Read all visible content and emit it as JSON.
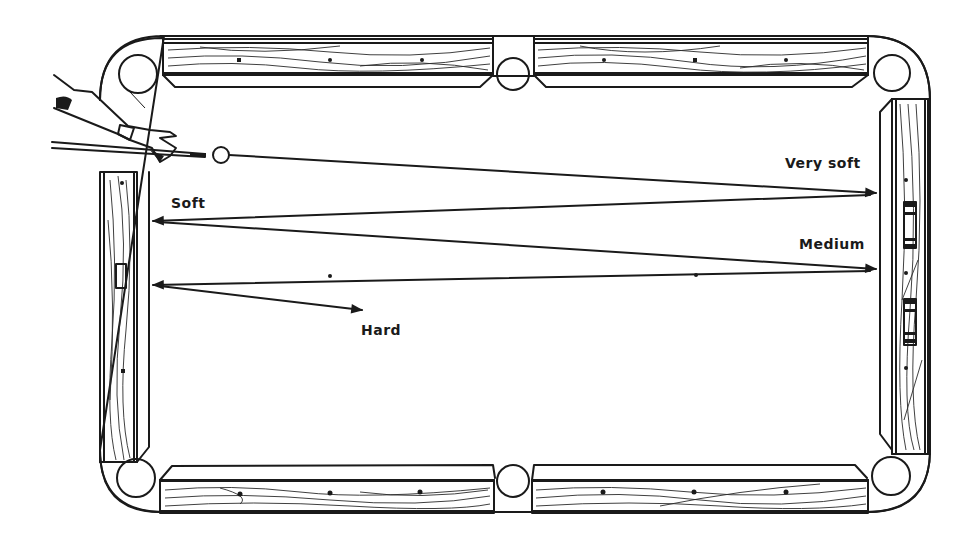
{
  "diagram": {
    "labels": {
      "very_soft": "Very soft",
      "soft": "Soft",
      "medium": "Medium",
      "hard": "Hard"
    },
    "colors": {
      "ink": "#1a1a1a",
      "background": "#ffffff"
    },
    "elements": {
      "cue_ball": "cue-ball",
      "cue_stick": "cue-stick",
      "hand": "player-hand",
      "pockets": [
        "top-left",
        "top-middle",
        "top-right",
        "bottom-left",
        "bottom-middle",
        "bottom-right"
      ],
      "rails": [
        "top-left-rail",
        "top-right-rail",
        "left-rail",
        "right-rail",
        "bottom-left-rail",
        "bottom-right-rail"
      ]
    },
    "shot_paths": [
      {
        "name": "very-soft",
        "label": "Very soft",
        "ends_at": "right-cushion"
      },
      {
        "name": "soft",
        "label": "Soft",
        "ends_at": "left-cushion"
      },
      {
        "name": "medium",
        "label": "Medium",
        "ends_at": "right-cushion"
      },
      {
        "name": "hard",
        "label": "Hard",
        "ends_at": "table-center-left"
      }
    ]
  }
}
